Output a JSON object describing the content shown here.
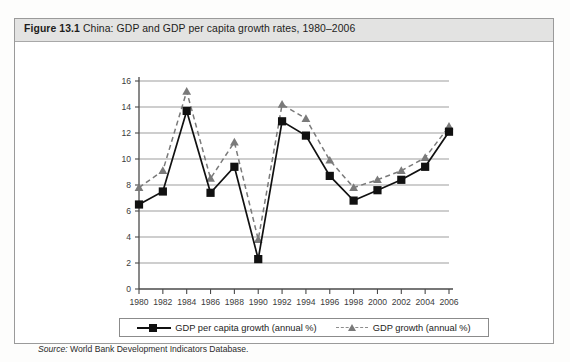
{
  "figure": {
    "label": "Figure 13.1",
    "caption": "China: GDP and GDP per capita growth rates, 1980–2006",
    "source_prefix": "Source:",
    "source_text": "World Bank Development Indicators Database."
  },
  "legend": {
    "items": [
      {
        "label": "GDP per capita growth (annual %)",
        "marker": "square",
        "line": "solid",
        "color": "#111111"
      },
      {
        "label": "GDP growth (annual %)",
        "marker": "triangle",
        "line": "dashed",
        "color": "#7a7a7a"
      }
    ]
  },
  "chart_data": {
    "type": "line",
    "title": "China: GDP and GDP per capita growth rates, 1980–2006",
    "xlabel": "",
    "ylabel": "",
    "ylim": [
      0,
      16
    ],
    "yticks": [
      0,
      2,
      4,
      6,
      8,
      10,
      12,
      14,
      16
    ],
    "xticks": [
      1980,
      1982,
      1984,
      1986,
      1988,
      1990,
      1992,
      1994,
      1996,
      1998,
      2000,
      2002,
      2004,
      2006
    ],
    "x": [
      1980,
      1982,
      1984,
      1986,
      1988,
      1990,
      1992,
      1994,
      1996,
      1998,
      2000,
      2002,
      2004,
      2006
    ],
    "grid": "horizontal",
    "legend_position": "bottom",
    "series": [
      {
        "name": "GDP per capita growth (annual %)",
        "marker": "square",
        "line": "solid",
        "color": "#111111",
        "values": [
          6.5,
          7.5,
          13.7,
          7.4,
          9.4,
          2.3,
          12.9,
          11.8,
          8.7,
          6.8,
          7.6,
          8.4,
          9.4,
          12.1
        ]
      },
      {
        "name": "GDP growth (annual %)",
        "marker": "triangle",
        "line": "dashed",
        "color": "#7a7a7a",
        "values": [
          7.8,
          9.1,
          15.2,
          8.5,
          11.3,
          3.8,
          14.2,
          13.1,
          9.9,
          7.8,
          8.4,
          9.1,
          10.1,
          12.5
        ]
      }
    ]
  }
}
